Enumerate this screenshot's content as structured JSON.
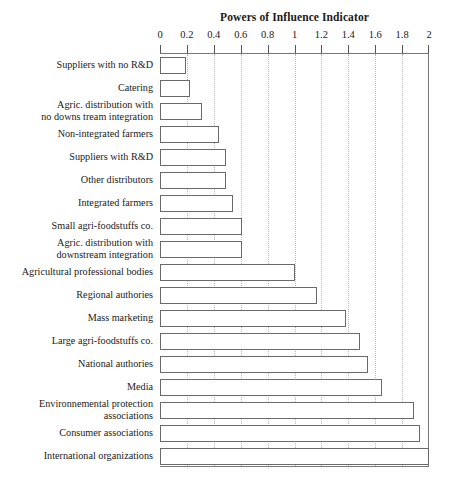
{
  "chart_data": {
    "type": "bar",
    "orientation": "horizontal",
    "title": "Powers of Influence Indicator",
    "xlabel": "",
    "ylabel": "",
    "xlim": [
      0,
      2
    ],
    "grid": true,
    "grid_axis": "x",
    "legend": null,
    "tick_labels": [
      "0",
      "0.2",
      "0.4",
      "0.6",
      "0.8",
      "1",
      "1.2",
      "1.4",
      "1.6",
      "1.8",
      "2"
    ],
    "tick_values": [
      0,
      0.2,
      0.4,
      0.6,
      0.8,
      1,
      1.2,
      1.4,
      1.6,
      1.8,
      2
    ],
    "categories": [
      "Suppliers with no R&D",
      "Catering",
      "Agric. distribution with\nno downs tream integration",
      "Non-integrated farmers",
      "Suppliers with R&D",
      "Other distributors",
      "Integrated farmers",
      "Small agri-foodstuffs co.",
      "Agric. distribution with\ndownstream integration",
      "Agricultural professional bodies",
      "Regional authories",
      "Mass marketing",
      "Large agri-foodstuffs co.",
      "National authories",
      "Media",
      "Environnemental protection\nassociations",
      "Consumer associations",
      "International organizations"
    ],
    "values": [
      0.19,
      0.22,
      0.31,
      0.44,
      0.49,
      0.49,
      0.54,
      0.61,
      0.61,
      1.0,
      1.17,
      1.38,
      1.49,
      1.55,
      1.65,
      1.89,
      1.93,
      2.0
    ]
  },
  "style": {
    "bar_fill": "#ffffff",
    "bar_stroke": "#6a6a6a",
    "grid_color": "#b8b8b8",
    "axis_color": "#777777",
    "text_color": "#1a1a1a",
    "background": "#ffffff"
  }
}
